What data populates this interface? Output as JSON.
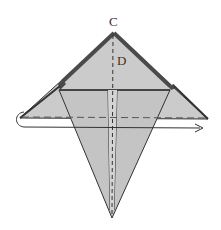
{
  "diagram": {
    "type": "origami-step",
    "labels": {
      "point_c": "C",
      "point_d": "D"
    },
    "colors": {
      "paper_fill": "#c8c8c8",
      "paper_back_fill": "#d0d0d0",
      "edge_stroke": "#333333",
      "thick_edge": "#4a4a4a",
      "background": "#ffffff"
    },
    "annotations": {
      "fold_line": "valley fold (dashed) across wings",
      "arrow": "fold behind and pull through to the right",
      "center_line": "dashed center crease C–D"
    }
  }
}
